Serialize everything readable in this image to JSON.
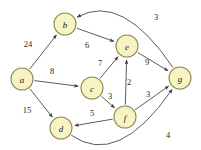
{
  "figure": {
    "name": "weighted-directed-graph",
    "background_color": "#ffffff",
    "node_fill_color": "#f7f3c2",
    "node_stroke_color": "#8d8a55",
    "edge_color": "#4a4a48"
  },
  "chart_data": {
    "type": "diagram",
    "title": "",
    "xlabel": "",
    "ylabel": "",
    "directed": true,
    "weighted": true,
    "nodes": [
      {
        "id": "a",
        "label": "a",
        "x": 22,
        "y": 79,
        "r": 11
      },
      {
        "id": "b",
        "label": "b",
        "x": 65,
        "y": 24,
        "r": 11
      },
      {
        "id": "c",
        "label": "c",
        "x": 92,
        "y": 88,
        "r": 11
      },
      {
        "id": "d",
        "label": "d",
        "x": 61,
        "y": 128,
        "r": 11
      },
      {
        "id": "e",
        "label": "e",
        "x": 127,
        "y": 46,
        "r": 11
      },
      {
        "id": "f",
        "label": "f",
        "x": 125,
        "y": 117,
        "r": 11
      },
      {
        "id": "g",
        "label": "g",
        "x": 180,
        "y": 78,
        "r": 11
      }
    ],
    "edges": [
      {
        "from": "a",
        "to": "b",
        "weight": 24,
        "label_x": 28,
        "label_y": 44,
        "curved": false
      },
      {
        "from": "a",
        "to": "c",
        "weight": 8,
        "label_x": 52,
        "label_y": 71,
        "curved": false
      },
      {
        "from": "a",
        "to": "d",
        "weight": 15,
        "label_x": 27,
        "label_y": 110,
        "curved": false
      },
      {
        "from": "b",
        "to": "e",
        "weight": 6,
        "label_x": 87,
        "label_y": 45,
        "curved": false
      },
      {
        "from": "c",
        "to": "e",
        "weight": 7,
        "label_x": 100,
        "label_y": 63,
        "curved": false
      },
      {
        "from": "c",
        "to": "f",
        "weight": 3,
        "label_x": 110,
        "label_y": 96,
        "curved": false
      },
      {
        "from": "f",
        "to": "e",
        "weight": 2,
        "label_x": 129,
        "label_y": 82,
        "curved": false
      },
      {
        "from": "e",
        "to": "g",
        "weight": 9,
        "label_x": 147,
        "label_y": 62,
        "curved": false
      },
      {
        "from": "f",
        "to": "g",
        "weight": 3,
        "label_x": 148,
        "label_y": 94,
        "curved": false
      },
      {
        "from": "f",
        "to": "d",
        "weight": 5,
        "label_x": 92,
        "label_y": 113,
        "curved": false
      },
      {
        "from": "g",
        "to": "b",
        "weight": 3,
        "label_x": 156,
        "label_y": 17,
        "curved": true
      },
      {
        "from": "d",
        "to": "g",
        "weight": 4,
        "label_x": 168,
        "label_y": 135,
        "curved": true
      }
    ],
    "weight_labels": [
      "24",
      "8",
      "15",
      "6",
      "7",
      "3",
      "2",
      "9",
      "3",
      "5",
      "3",
      "4"
    ],
    "node_labels": [
      "a",
      "b",
      "c",
      "d",
      "e",
      "f",
      "g"
    ]
  }
}
